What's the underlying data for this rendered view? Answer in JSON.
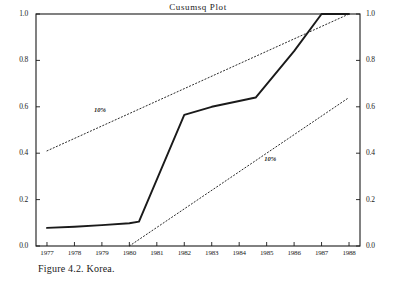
{
  "figure": {
    "title": "Cusumsq  Plot",
    "caption": "Figure 4.2. Korea."
  },
  "chart_data": {
    "type": "line",
    "title": "Cusumsq  Plot",
    "xlabel": "",
    "ylabel": "",
    "xlim": [
      1976.6,
      1988.4
    ],
    "ylim": [
      0.0,
      1.0
    ],
    "grid": false,
    "legend": "none",
    "x_ticks": [
      "1977",
      "1978",
      "1979",
      "1980",
      "1981",
      "1982",
      "1983",
      "1984",
      "1985",
      "1986",
      "1987",
      "1988"
    ],
    "y_ticks_left": [
      "0.0",
      "0.2",
      "0.4",
      "0.6",
      "0.8",
      "1.0"
    ],
    "y_ticks_right": [
      "0.0",
      "0.2",
      "0.4",
      "0.6",
      "0.8",
      "1.0"
    ],
    "annotations": [
      {
        "text": "10%",
        "x": 1979.0,
        "y": 0.585
      },
      {
        "text": "10%",
        "x": 1985.2,
        "y": 0.375
      }
    ],
    "series": [
      {
        "name": "CUSUMSQ",
        "style": "solid",
        "x": [
          1977.0,
          1978.0,
          1979.0,
          1980.0,
          1980.35,
          1982.0,
          1983.0,
          1984.0,
          1984.6,
          1986.0,
          1987.0,
          1988.0
        ],
        "values": [
          0.078,
          0.083,
          0.09,
          0.098,
          0.105,
          0.565,
          0.6,
          0.625,
          0.64,
          0.84,
          1.0,
          1.0
        ]
      },
      {
        "name": "10% upper bound",
        "style": "dotted",
        "x": [
          1977.0,
          1988.0
        ],
        "values": [
          0.41,
          1.0
        ]
      },
      {
        "name": "10% lower bound",
        "style": "dotted",
        "x": [
          1980.0,
          1988.0
        ],
        "values": [
          0.0,
          0.64
        ]
      }
    ]
  },
  "axes": {
    "left_ticks": [
      {
        "label": "1.0",
        "value": 1.0
      },
      {
        "label": "0.8",
        "value": 0.8
      },
      {
        "label": "0.6",
        "value": 0.6
      },
      {
        "label": "0.4",
        "value": 0.4
      },
      {
        "label": "0.2",
        "value": 0.2
      },
      {
        "label": "0.0",
        "value": 0.0
      }
    ],
    "right_ticks": [
      {
        "label": "1.0",
        "value": 1.0
      },
      {
        "label": "0.8",
        "value": 0.8
      },
      {
        "label": "0.6",
        "value": 0.6
      },
      {
        "label": "0.4",
        "value": 0.4
      },
      {
        "label": "0.2",
        "value": 0.2
      },
      {
        "label": "0.0",
        "value": 0.0
      }
    ],
    "x_ticks": [
      {
        "label": "1977",
        "value": 1977
      },
      {
        "label": "1978",
        "value": 1978
      },
      {
        "label": "1979",
        "value": 1979
      },
      {
        "label": "1980",
        "value": 1980
      },
      {
        "label": "1981",
        "value": 1981
      },
      {
        "label": "1982",
        "value": 1982
      },
      {
        "label": "1983",
        "value": 1983
      },
      {
        "label": "1984",
        "value": 1984
      },
      {
        "label": "1985",
        "value": 1985
      },
      {
        "label": "1986",
        "value": 1986
      },
      {
        "label": "1987",
        "value": 1987
      },
      {
        "label": "1988",
        "value": 1988
      }
    ]
  },
  "style": {
    "axis_color": "#1a1a1a",
    "series_color": "#1a1a1a",
    "bound_color": "#2b2b2b",
    "background": "#ffffff"
  }
}
